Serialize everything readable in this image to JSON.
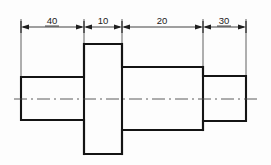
{
  "drawing": {
    "title": "Stepped shaft front view with linear dimensions",
    "view_type": "front-view",
    "canvas": {
      "width": 271,
      "height": 165,
      "background": "#fdfdfd"
    },
    "colors": {
      "outline": "#141414",
      "dimension": "#1f1f1f",
      "extension": "#2b2b2b",
      "centerline": "#4a4a4a",
      "text": "#1a1a1a"
    },
    "dimensions": [
      {
        "label": "40",
        "value": 40,
        "underlined": true,
        "x_start": 21,
        "x_end": 84,
        "text_x": 52,
        "text_y": 24
      },
      {
        "label": "10",
        "value": 10,
        "underlined": false,
        "x_start": 84,
        "x_end": 122,
        "text_x": 103,
        "text_y": 24
      },
      {
        "label": "20",
        "value": 20,
        "underlined": false,
        "x_start": 122,
        "x_end": 203,
        "text_x": 162,
        "text_y": 24
      },
      {
        "label": "30",
        "value": 30,
        "underlined": true,
        "x_start": 203,
        "x_end": 246,
        "text_x": 224,
        "text_y": 24
      }
    ],
    "dimension_line_y": 27,
    "extension_lines": [
      {
        "x": 21,
        "y_top": 19,
        "y_bottom": 79
      },
      {
        "x": 84,
        "y_top": 19,
        "y_bottom": 46
      },
      {
        "x": 122,
        "y_top": 19,
        "y_bottom": 69
      },
      {
        "x": 203,
        "y_top": 19,
        "y_bottom": 78
      },
      {
        "x": 246,
        "y_top": 19,
        "y_bottom": 78
      }
    ],
    "sections": [
      {
        "name": "left-journal",
        "dimension_label": "40",
        "x": 21,
        "y": 77,
        "width": 63,
        "height": 43
      },
      {
        "name": "flange-collar",
        "dimension_label": "10",
        "x": 84,
        "y": 44,
        "width": 38,
        "height": 110
      },
      {
        "name": "middle-body",
        "dimension_label": "20",
        "x": 122,
        "y": 67,
        "width": 81,
        "height": 63
      },
      {
        "name": "right-journal",
        "dimension_label": "30",
        "x": 203,
        "y": 76,
        "width": 43,
        "height": 45
      }
    ],
    "center_line": {
      "y": 99,
      "x_start": 14,
      "x_end": 258,
      "pattern": "dash-dot"
    }
  }
}
